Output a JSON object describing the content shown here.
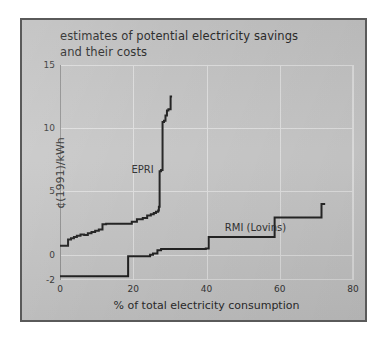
{
  "figure": {
    "title": "estimates of potential electricity savings\nand their costs",
    "background_color": "#c4c4c4",
    "frame_color": "#5a5a5a",
    "line_color": "#1d1d1d"
  },
  "chart_data": {
    "type": "line",
    "title": "estimates of potential electricity savings and their costs",
    "xlabel": "% of total electricity consumption",
    "ylabel": "¢(1991)/kWh",
    "xlim": [
      0,
      80
    ],
    "ylim": [
      -2,
      15
    ],
    "xticks": [
      0,
      20,
      40,
      60,
      80
    ],
    "xtick_labels": [
      "0",
      "20",
      "40",
      "60",
      "80"
    ],
    "yticks": [
      -2,
      0,
      5,
      10,
      15
    ],
    "ytick_labels": [
      "-2",
      "0",
      "5",
      "10",
      "15"
    ],
    "grid": true,
    "legend": "annotations-on-plot",
    "step_type": "post",
    "series": [
      {
        "name": "EPRI",
        "annotation": "EPRI",
        "annotation_x": 19.5,
        "annotation_y": 7.2,
        "x": [
          0.0,
          1.2,
          2.2,
          3.0,
          3.8,
          4.6,
          5.6,
          6.6,
          7.6,
          8.6,
          9.6,
          10.6,
          11.6,
          12.6,
          18.0,
          19.6,
          21.0,
          22.6,
          23.8,
          24.8,
          25.6,
          26.2,
          26.8,
          27.0,
          27.2,
          27.6,
          28.0,
          28.4,
          28.8,
          29.2,
          29.6,
          30.2,
          30.6
        ],
        "y": [
          0.7,
          0.7,
          1.2,
          1.3,
          1.4,
          1.5,
          1.6,
          1.55,
          1.7,
          1.8,
          1.9,
          2.0,
          2.4,
          2.45,
          2.45,
          2.6,
          2.8,
          2.9,
          3.1,
          3.2,
          3.3,
          3.4,
          3.5,
          3.8,
          6.6,
          6.7,
          10.5,
          10.6,
          11.0,
          11.4,
          11.5,
          12.5,
          12.5
        ]
      },
      {
        "name": "RMI (Lovins)",
        "annotation": "RMI (Lovins)",
        "annotation_x": 45.0,
        "annotation_y": 2.6,
        "x": [
          0.0,
          18.4,
          18.6,
          23.0,
          24.6,
          25.4,
          26.6,
          27.6,
          39.8,
          40.6,
          57.6,
          58.6,
          70.6,
          71.4,
          72.4
        ],
        "y": [
          -1.7,
          -1.7,
          -0.12,
          -0.12,
          0.0,
          0.1,
          0.35,
          0.45,
          0.5,
          1.4,
          1.4,
          2.95,
          2.95,
          4.0,
          4.0
        ]
      }
    ]
  }
}
